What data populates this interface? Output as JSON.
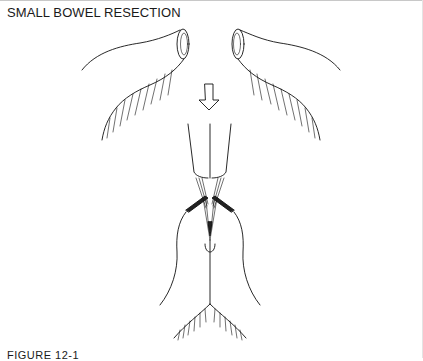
{
  "document": {
    "title": "SMALL BOWEL RESECTION",
    "caption": "FIGURE 12-1"
  },
  "illustration": {
    "subject": "small-bowel-resection-diagram",
    "parts": [
      "left-bowel-segment",
      "right-bowel-segment",
      "down-arrow",
      "anastomosis",
      "mesentery"
    ],
    "stroke_color": "#111111",
    "background": "#ffffff"
  }
}
